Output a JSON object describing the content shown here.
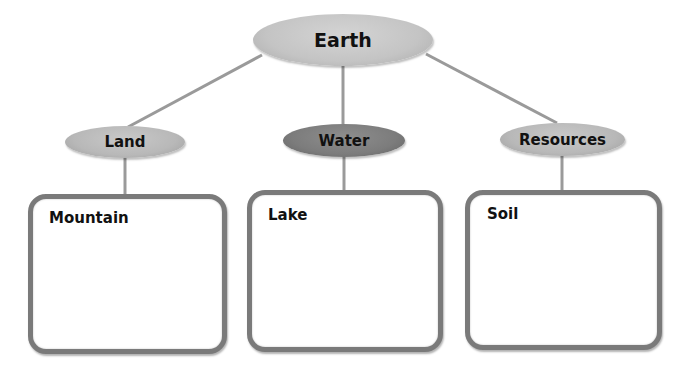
{
  "diagram": {
    "type": "concept-map",
    "root": {
      "label": "Earth",
      "fill": "#c4c4c4"
    },
    "categories": [
      {
        "label": "Land",
        "fill": "#b8b8b8",
        "example": "Mountain"
      },
      {
        "label": "Water",
        "fill": "#7c7c7c",
        "example": "Lake"
      },
      {
        "label": "Resources",
        "fill": "#b8b8b8",
        "example": "Soil"
      }
    ],
    "colors": {
      "connector": "#9a9a9a",
      "box_border": "#7a7a7a",
      "text": "#111111",
      "background": "#ffffff"
    }
  }
}
